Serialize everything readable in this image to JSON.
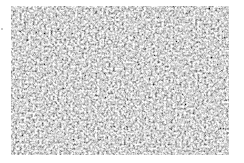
{
  "image": {
    "description": "grayscale noise / granular texture",
    "colors": {
      "base": "#b4b4b4",
      "light": "#f0f0f0",
      "dark": "#5a5a5a"
    }
  }
}
